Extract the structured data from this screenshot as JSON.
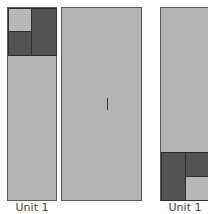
{
  "diagram": {
    "panels": [
      {
        "name": "left-panel",
        "label": "Unit 1",
        "highlight": "top"
      },
      {
        "name": "middle-panel",
        "label": "",
        "marker": "I"
      },
      {
        "name": "right-panel",
        "label": "Unit 1",
        "highlight": "bottom"
      }
    ],
    "colors": {
      "panel": "#b4b4b4",
      "dark": "#545454",
      "border": "#2e2e2e"
    }
  }
}
